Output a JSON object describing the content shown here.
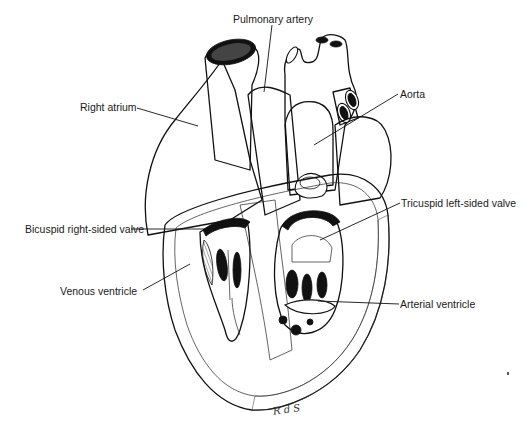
{
  "figure": {
    "labels": {
      "pulmonary_artery": "Pulmonary artery",
      "right_atrium": "Right atrium",
      "aorta": "Aorta",
      "bicuspid_valve": "Bicuspid right-sided valve",
      "tricuspid_valve": "Tricuspid left-sided valve",
      "venous_ventricle": "Venous ventricle",
      "arterial_ventricle": "Arterial ventricle"
    },
    "signature": "R d S"
  }
}
